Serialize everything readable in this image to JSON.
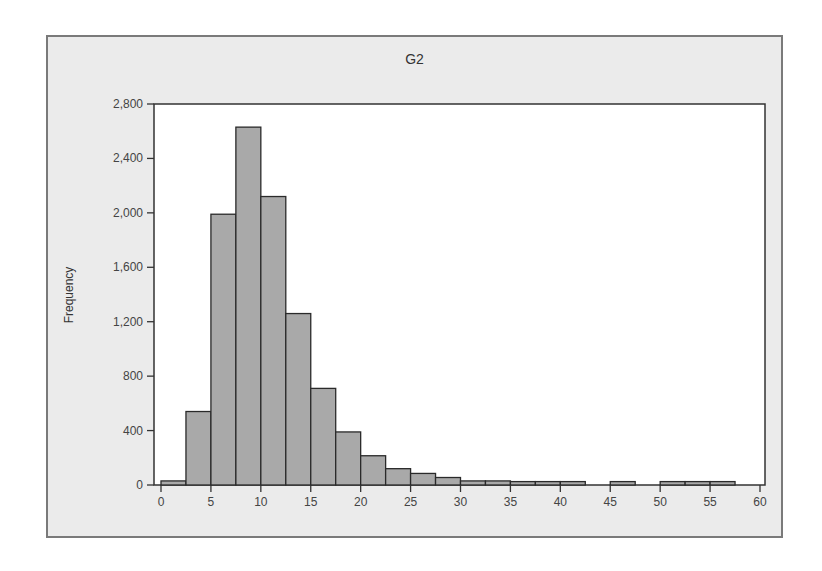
{
  "chart_data": {
    "type": "bar",
    "title": "G2",
    "xlabel": "",
    "ylabel": "Frequency",
    "bin_width": 2.5,
    "bin_edges": [
      0,
      2.5,
      5,
      7.5,
      10,
      12.5,
      15,
      17.5,
      20,
      22.5,
      25,
      27.5,
      30,
      32.5,
      35,
      37.5,
      40,
      42.5,
      45,
      47.5,
      50,
      52.5,
      55,
      57.5,
      60
    ],
    "values": [
      30,
      540,
      1990,
      2630,
      2120,
      1260,
      710,
      390,
      215,
      120,
      85,
      55,
      30,
      30,
      25,
      25,
      25,
      0,
      25,
      0,
      25,
      25,
      25,
      0
    ],
    "xlim": [
      0,
      60
    ],
    "ylim": [
      0,
      2800
    ],
    "x_ticks": [
      0,
      5,
      10,
      15,
      20,
      25,
      30,
      35,
      40,
      45,
      50,
      55,
      60
    ],
    "y_ticks": [
      0,
      400,
      800,
      1200,
      1600,
      2000,
      2400,
      2800
    ],
    "y_tick_labels": [
      "0",
      "400",
      "800",
      "1,200",
      "1,600",
      "2,000",
      "2,400",
      "2,800"
    ],
    "grid": false,
    "legend": null,
    "colors": {
      "bar_fill": "#a9a9a9",
      "bar_edge": "#2a2a2a",
      "plot_bg": "#ffffff",
      "frame_bg": "#ebebeb"
    }
  }
}
